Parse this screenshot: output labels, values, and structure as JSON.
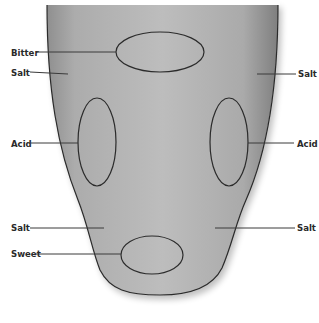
{
  "diagram": {
    "type": "tongue-taste-map",
    "colors": {
      "tongue_fill_light": "#b9b9b9",
      "tongue_fill_dark": "#8a8a8a",
      "outline": "#2b2b2b",
      "leader_line": "#3a3a3a",
      "label": "#2a2a2a"
    },
    "regions": [
      {
        "id": "bitter",
        "label": "Bitter",
        "shape": "ellipse",
        "cx": 160,
        "cy": 52,
        "rx": 44,
        "ry": 20
      },
      {
        "id": "acid-left",
        "label": "Acid",
        "shape": "ellipse",
        "cx": 97,
        "cy": 142,
        "rx": 19,
        "ry": 44
      },
      {
        "id": "acid-right",
        "label": "Acid",
        "shape": "ellipse",
        "cx": 229,
        "cy": 142,
        "rx": 19,
        "ry": 44
      },
      {
        "id": "sweet",
        "label": "Sweet",
        "shape": "ellipse",
        "cx": 152,
        "cy": 255,
        "rx": 31,
        "ry": 19
      }
    ],
    "labels": [
      {
        "id": "bitter",
        "text": "Bitter",
        "x": 11,
        "y": 56,
        "line": [
          36,
          52,
          116,
          52
        ]
      },
      {
        "id": "salt-upper-left",
        "text": "Salt",
        "x": 11,
        "y": 76,
        "line": [
          30,
          72,
          68,
          74
        ]
      },
      {
        "id": "salt-upper-right",
        "text": "Salt",
        "x": 298,
        "y": 77,
        "line": [
          257,
          74,
          296,
          74
        ]
      },
      {
        "id": "acid-left",
        "text": "Acid",
        "x": 11,
        "y": 147,
        "line": [
          31,
          143,
          78,
          143
        ]
      },
      {
        "id": "acid-right",
        "text": "Acid",
        "x": 297,
        "y": 147,
        "line": [
          248,
          143,
          294,
          143
        ]
      },
      {
        "id": "salt-lower-left",
        "text": "Salt",
        "x": 11,
        "y": 231,
        "line": [
          30,
          228,
          104,
          228
        ]
      },
      {
        "id": "sweet",
        "text": "Sweet",
        "x": 11,
        "y": 257,
        "line": [
          36,
          254,
          121,
          254
        ]
      },
      {
        "id": "salt-lower-right",
        "text": "Salt",
        "x": 297,
        "y": 231,
        "line": [
          215,
          228,
          295,
          228
        ]
      }
    ]
  }
}
